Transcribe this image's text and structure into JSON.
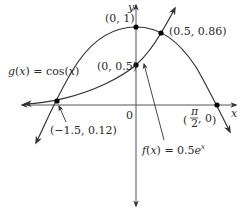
{
  "figure": {
    "axes": {
      "x_label": "x",
      "y_label": "y",
      "origin_label": "0"
    },
    "functions": [
      {
        "name": "g",
        "label": "g(x) = cos(x)",
        "expression": "cos(x)"
      },
      {
        "name": "f",
        "label": "f(x) = 0.5e^x",
        "expression": "0.5e^x"
      }
    ],
    "points": [
      {
        "label": "(0, 1)",
        "x": 0,
        "y": 1
      },
      {
        "label": "(0.5, 0.86)",
        "x": 0.5,
        "y": 0.86
      },
      {
        "label": "(0, 0.5)",
        "x": 0,
        "y": 0.5
      },
      {
        "label": "(−1.5, 0.12)",
        "x": -1.5,
        "y": 0.12
      },
      {
        "label": "(π/2, 0)",
        "x": 1.5708,
        "y": 0
      }
    ],
    "labels": {
      "g_label": "g(x) = cos(x)",
      "f_label_base": "f(x) = 0.5e",
      "f_label_exp": "x",
      "p_top": "(0, 1)",
      "p_intersect": "(0.5, 0.86)",
      "p_yint_f": "(0, 0.5)",
      "p_left": "(−1.5, 0.12)",
      "p_pi_num": "π",
      "p_pi_den": "2",
      "p_pi_rest": ", 0"
    },
    "colors": {
      "stroke": "#333333",
      "axis": "#555555",
      "point": "#000000"
    }
  }
}
